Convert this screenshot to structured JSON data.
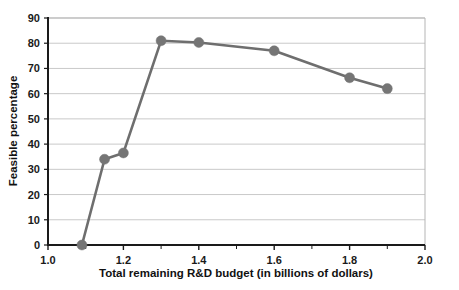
{
  "chart_data": {
    "type": "line",
    "title": "",
    "xlabel": "Total remaining R&D budget (in billions of dollars)",
    "ylabel": "Feasible percentage",
    "xlim": [
      1.0,
      2.0
    ],
    "ylim": [
      0,
      90
    ],
    "xticks": [
      "1.0",
      "1.2",
      "1.4",
      "1.6",
      "1.8",
      "2.0"
    ],
    "xtick_values": [
      1.0,
      1.2,
      1.4,
      1.6,
      1.8,
      2.0
    ],
    "xminor_step": 0.1,
    "yticks": [
      "0",
      "10",
      "20",
      "30",
      "40",
      "50",
      "60",
      "70",
      "80",
      "90"
    ],
    "ytick_values": [
      0,
      10,
      20,
      30,
      40,
      50,
      60,
      70,
      80,
      90
    ],
    "grid": "horizontal",
    "legend": "none",
    "series": [
      {
        "name": "Feasible percentage",
        "color": "#6e6e6e",
        "marker": "circle",
        "x": [
          1.09,
          1.15,
          1.2,
          1.3,
          1.4,
          1.6,
          1.8,
          1.9
        ],
        "values": [
          0,
          34,
          36.5,
          81,
          80.3,
          77,
          66.3,
          62
        ]
      }
    ]
  },
  "colors": {
    "line": "#6e6e6e",
    "marker": "#757575",
    "grid": "#c9c9c9",
    "axis": "#1a1a1a",
    "frame": "#b5b5b5",
    "background": "#ffffff"
  }
}
